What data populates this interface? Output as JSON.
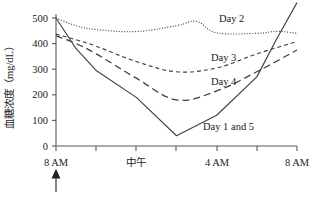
{
  "chart_data": {
    "type": "line",
    "title": "",
    "xlabel": "",
    "ylabel": "血糖浓度（mg/dL）",
    "ylim": [
      0,
      500
    ],
    "xlim": [
      0,
      24
    ],
    "grid": false,
    "legend_position": "inline-annotations",
    "y_ticks": [
      0,
      100,
      200,
      300,
      400,
      500
    ],
    "y_tick_labels": [
      "0",
      "100",
      "200",
      "300",
      "400",
      "500"
    ],
    "x_ticks": [
      0,
      4,
      8,
      12,
      16,
      20,
      24
    ],
    "x_tick_labels": [
      "8 AM",
      "",
      "中午",
      "",
      "4 AM",
      "",
      "8 AM"
    ],
    "x_hours_from_8am": [
      0,
      4,
      8,
      12,
      16,
      20,
      24
    ],
    "annotations": [
      {
        "name": "dose-arrow",
        "text": "↑",
        "x": 0,
        "note": "upward arrow beneath first 8 AM tick"
      }
    ],
    "series": [
      {
        "name": "Day 1 and 5",
        "label": "Day 1 and 5",
        "style": "solid",
        "x": [
          0,
          2,
          4,
          8,
          12,
          16,
          20,
          22,
          24
        ],
        "values": [
          500,
          380,
          295,
          190,
          40,
          120,
          270,
          420,
          560
        ]
      },
      {
        "name": "Day 2",
        "label": "Day 2",
        "style": "dotted",
        "x": [
          0,
          2,
          4,
          8,
          12,
          14,
          16,
          20,
          22,
          24
        ],
        "values": [
          500,
          470,
          455,
          447,
          470,
          487,
          442,
          440,
          448,
          440
        ]
      },
      {
        "name": "Day 3",
        "label": "Day 3",
        "style": "dashed-short",
        "x": [
          0,
          2,
          4,
          8,
          12,
          16,
          20,
          24
        ],
        "values": [
          437,
          415,
          390,
          330,
          290,
          305,
          360,
          408
        ]
      },
      {
        "name": "Day 4",
        "label": "Day 4",
        "style": "dashed-long",
        "x": [
          0,
          2,
          4,
          8,
          12,
          16,
          20,
          24
        ],
        "values": [
          430,
          400,
          360,
          265,
          180,
          215,
          290,
          375
        ]
      }
    ]
  },
  "axis": {
    "y_label": "血糖浓度（mg/dL）",
    "y_tick_500": "500",
    "y_tick_400": "400",
    "y_tick_300": "300",
    "y_tick_200": "200",
    "y_tick_100": "100",
    "y_tick_0": "0",
    "x_tick_0": "8 AM",
    "x_tick_noon": "中午",
    "x_tick_4am": "4 AM",
    "x_tick_8am_end": "8 AM"
  },
  "series_labels": {
    "day2": "Day 2",
    "day3": "Day 3",
    "day4": "Day 4",
    "day1and5": "Day 1 and 5"
  }
}
